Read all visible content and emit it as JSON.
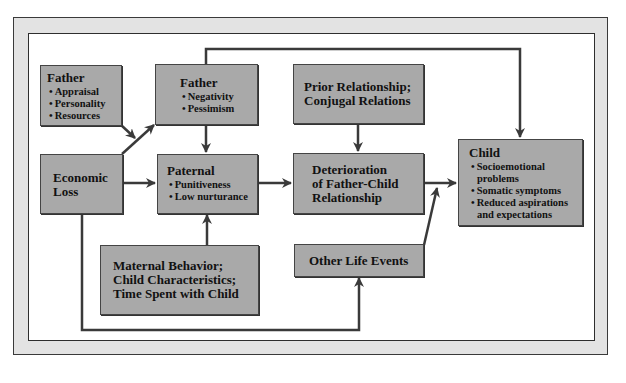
{
  "diagram": {
    "boxes": {
      "father_traits": {
        "title": "Father",
        "items": [
          "Appraisal",
          "Personality",
          "Resources"
        ]
      },
      "father_state": {
        "title": "Father",
        "items": [
          "Negativity",
          "Pessimism"
        ]
      },
      "prior_relationship": {
        "lines": [
          "Prior Relationship;",
          "Conjugal Relations"
        ]
      },
      "economic_loss": {
        "lines": [
          "Economic",
          "Loss"
        ]
      },
      "paternal": {
        "title": "Paternal",
        "items": [
          "Punitiveness",
          "Low nurturance"
        ]
      },
      "deterioration": {
        "lines": [
          "Deterioration",
          "of Father-Child",
          "Relationship"
        ]
      },
      "child": {
        "title": "Child",
        "items": [
          "Socioemotional problems",
          "Somatic symptoms",
          "Reduced aspirations and expectations"
        ]
      },
      "maternal": {
        "lines": [
          "Maternal Behavior;",
          "Child Characteristics;",
          "Time Spent with Child"
        ]
      },
      "other_events": {
        "lines": [
          "Other Life Events"
        ]
      }
    },
    "edges": [
      {
        "from": "father_traits",
        "to": "father_state"
      },
      {
        "from": "economic_loss",
        "to": "father_state"
      },
      {
        "from": "economic_loss",
        "to": "paternal"
      },
      {
        "from": "economic_loss",
        "to": "other_events"
      },
      {
        "from": "father_state",
        "to": "paternal"
      },
      {
        "from": "father_state",
        "to": "child"
      },
      {
        "from": "maternal",
        "to": "paternal"
      },
      {
        "from": "paternal",
        "to": "deterioration"
      },
      {
        "from": "prior_relationship",
        "to": "deterioration"
      },
      {
        "from": "deterioration",
        "to": "child"
      },
      {
        "from": "other_events",
        "to": "child"
      }
    ],
    "colors": {
      "box_fill": "#a9a9a9",
      "frame_fill": "#e3e3e3",
      "arrow": "#3a3a3a"
    }
  }
}
